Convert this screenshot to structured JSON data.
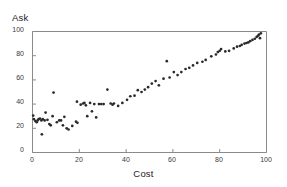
{
  "chart_data": {
    "type": "scatter",
    "title": "",
    "xlabel": "Cost",
    "ylabel": "Ask",
    "xlim": [
      0,
      100
    ],
    "ylim": [
      0,
      100
    ],
    "xticks": [
      0,
      20,
      40,
      60,
      80,
      100
    ],
    "yticks": [
      0,
      20,
      40,
      60,
      80,
      100
    ],
    "grid": false,
    "legend": null,
    "marker": "dot",
    "marker_color": "#2a2a2a",
    "points": [
      {
        "x": 0.3,
        "y": 30.5
      },
      {
        "x": 0.6,
        "y": 27.5
      },
      {
        "x": 1.2,
        "y": 26.0
      },
      {
        "x": 1.8,
        "y": 25.0
      },
      {
        "x": 2.2,
        "y": 26.5
      },
      {
        "x": 2.6,
        "y": 27.5
      },
      {
        "x": 3.2,
        "y": 28.0
      },
      {
        "x": 3.8,
        "y": 26.5
      },
      {
        "x": 4.4,
        "y": 27.5
      },
      {
        "x": 4.0,
        "y": 15.0
      },
      {
        "x": 5.2,
        "y": 26.5
      },
      {
        "x": 5.6,
        "y": 33.0
      },
      {
        "x": 6.4,
        "y": 27.0
      },
      {
        "x": 7.2,
        "y": 23.5
      },
      {
        "x": 7.8,
        "y": 22.5
      },
      {
        "x": 8.6,
        "y": 30.0
      },
      {
        "x": 9.0,
        "y": 49.5
      },
      {
        "x": 10.4,
        "y": 25.0
      },
      {
        "x": 11.4,
        "y": 26.5
      },
      {
        "x": 12.2,
        "y": 26.5
      },
      {
        "x": 13.0,
        "y": 22.5
      },
      {
        "x": 13.6,
        "y": 29.5
      },
      {
        "x": 14.6,
        "y": 20.0
      },
      {
        "x": 15.4,
        "y": 19.0
      },
      {
        "x": 17.0,
        "y": 22.0
      },
      {
        "x": 18.6,
        "y": 25.5
      },
      {
        "x": 19.2,
        "y": 24.5
      },
      {
        "x": 19.0,
        "y": 42.0
      },
      {
        "x": 20.6,
        "y": 39.5
      },
      {
        "x": 21.6,
        "y": 40.5
      },
      {
        "x": 22.2,
        "y": 41.0
      },
      {
        "x": 22.8,
        "y": 39.0
      },
      {
        "x": 23.4,
        "y": 30.0
      },
      {
        "x": 24.6,
        "y": 41.0
      },
      {
        "x": 25.4,
        "y": 34.0
      },
      {
        "x": 26.4,
        "y": 40.0
      },
      {
        "x": 27.2,
        "y": 29.0
      },
      {
        "x": 28.4,
        "y": 40.0
      },
      {
        "x": 29.4,
        "y": 40.0
      },
      {
        "x": 30.4,
        "y": 40.0
      },
      {
        "x": 32.0,
        "y": 52.0
      },
      {
        "x": 33.4,
        "y": 40.5
      },
      {
        "x": 34.2,
        "y": 39.5
      },
      {
        "x": 34.8,
        "y": 40.5
      },
      {
        "x": 36.6,
        "y": 38.5
      },
      {
        "x": 38.4,
        "y": 41.0
      },
      {
        "x": 40.4,
        "y": 43.5
      },
      {
        "x": 41.8,
        "y": 46.5
      },
      {
        "x": 43.6,
        "y": 47.0
      },
      {
        "x": 45.0,
        "y": 51.5
      },
      {
        "x": 46.6,
        "y": 50.0
      },
      {
        "x": 48.0,
        "y": 52.0
      },
      {
        "x": 49.4,
        "y": 54.0
      },
      {
        "x": 51.0,
        "y": 57.0
      },
      {
        "x": 52.6,
        "y": 59.0
      },
      {
        "x": 54.0,
        "y": 55.5
      },
      {
        "x": 56.0,
        "y": 61.0
      },
      {
        "x": 57.4,
        "y": 75.5
      },
      {
        "x": 58.6,
        "y": 62.0
      },
      {
        "x": 60.4,
        "y": 66.5
      },
      {
        "x": 62.0,
        "y": 64.0
      },
      {
        "x": 63.6,
        "y": 66.5
      },
      {
        "x": 65.4,
        "y": 69.0
      },
      {
        "x": 67.0,
        "y": 70.0
      },
      {
        "x": 68.6,
        "y": 72.0
      },
      {
        "x": 70.4,
        "y": 74.0
      },
      {
        "x": 72.6,
        "y": 75.0
      },
      {
        "x": 74.0,
        "y": 76.5
      },
      {
        "x": 76.4,
        "y": 79.5
      },
      {
        "x": 78.4,
        "y": 81.0
      },
      {
        "x": 79.2,
        "y": 83.0
      },
      {
        "x": 80.0,
        "y": 84.0
      },
      {
        "x": 80.6,
        "y": 85.5
      },
      {
        "x": 82.4,
        "y": 83.5
      },
      {
        "x": 84.0,
        "y": 84.0
      },
      {
        "x": 86.0,
        "y": 86.0
      },
      {
        "x": 87.4,
        "y": 87.5
      },
      {
        "x": 88.6,
        "y": 88.0
      },
      {
        "x": 89.4,
        "y": 89.0
      },
      {
        "x": 90.6,
        "y": 90.0
      },
      {
        "x": 91.4,
        "y": 90.5
      },
      {
        "x": 92.2,
        "y": 91.0
      },
      {
        "x": 93.0,
        "y": 92.0
      },
      {
        "x": 94.0,
        "y": 93.0
      },
      {
        "x": 95.0,
        "y": 94.0
      },
      {
        "x": 95.8,
        "y": 95.5
      },
      {
        "x": 96.4,
        "y": 96.5
      },
      {
        "x": 96.8,
        "y": 97.5
      },
      {
        "x": 97.2,
        "y": 94.5
      },
      {
        "x": 97.6,
        "y": 98.5
      }
    ]
  },
  "axes": {
    "ylabel_text": "Ask",
    "xlabel_text": "Cost",
    "ytick_labels": [
      "100",
      "80",
      "60",
      "40",
      "20",
      "0"
    ],
    "xtick_labels": [
      "0",
      "20",
      "40",
      "60",
      "80",
      "100"
    ]
  }
}
